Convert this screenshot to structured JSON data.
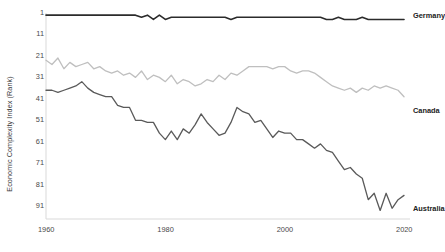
{
  "chart_data": {
    "type": "line",
    "title": "",
    "xlabel": "",
    "ylabel": "Economic Complexity Index (Rank)",
    "xlim": [
      1960,
      2021
    ],
    "ylim": [
      1,
      97
    ],
    "y_inverted": true,
    "grid": false,
    "legend_position": "right-of-line-ends",
    "x_tick_labels": [
      "1960",
      "1980",
      "2000",
      "2020"
    ],
    "x_ticks": [
      1960,
      1980,
      2000,
      2020
    ],
    "y_tick_labels": [
      "1",
      "11",
      "21",
      "31",
      "41",
      "51",
      "61",
      "71",
      "81",
      "91"
    ],
    "y_ticks": [
      1,
      11,
      21,
      31,
      41,
      51,
      61,
      71,
      81,
      91
    ],
    "x": [
      1960,
      1961,
      1962,
      1963,
      1964,
      1965,
      1966,
      1967,
      1968,
      1969,
      1970,
      1971,
      1972,
      1973,
      1974,
      1975,
      1976,
      1977,
      1978,
      1979,
      1980,
      1981,
      1982,
      1983,
      1984,
      1985,
      1986,
      1987,
      1988,
      1989,
      1990,
      1991,
      1992,
      1993,
      1994,
      1995,
      1996,
      1997,
      1998,
      1999,
      2000,
      2001,
      2002,
      2003,
      2004,
      2005,
      2006,
      2007,
      2008,
      2009,
      2010,
      2011,
      2012,
      2013,
      2014,
      2015,
      2016,
      2017,
      2018,
      2019,
      2020
    ],
    "series": [
      {
        "name": "Germany",
        "color": "#2b2b2b",
        "width": 1.6,
        "label_x": 2021,
        "label_y": 2,
        "values": [
          2,
          2,
          2,
          2,
          2,
          2,
          2,
          2,
          2,
          2,
          2,
          2,
          2,
          2,
          2,
          2,
          3,
          2,
          4,
          2,
          4,
          3,
          3,
          3,
          3,
          3,
          3,
          3,
          3,
          3,
          3,
          4,
          3,
          3,
          3,
          3,
          3,
          3,
          3,
          3,
          3,
          3,
          3,
          3,
          3,
          3,
          3,
          4,
          4,
          3,
          4,
          4,
          4,
          3,
          4,
          4,
          4,
          4,
          4,
          4,
          4
        ]
      },
      {
        "name": "Canada",
        "color": "#bfbfbf",
        "width": 1.3,
        "label_x": 2021,
        "label_y": 46,
        "values": [
          23,
          25,
          22,
          27,
          24,
          26,
          25,
          24,
          27,
          26,
          28,
          29,
          28,
          30,
          29,
          31,
          28,
          32,
          30,
          31,
          33,
          30,
          34,
          32,
          33,
          35,
          34,
          32,
          33,
          30,
          32,
          29,
          30,
          28,
          26,
          26,
          26,
          26,
          27,
          26,
          26,
          28,
          29,
          28,
          28,
          29,
          31,
          33,
          35,
          36,
          37,
          36,
          38,
          36,
          37,
          35,
          36,
          35,
          36,
          37,
          40
        ]
      },
      {
        "name": "Australia",
        "color": "#5a5a5a",
        "width": 1.3,
        "label_x": 2021,
        "label_y": 92,
        "values": [
          37,
          37,
          38,
          37,
          36,
          35,
          33,
          36,
          38,
          39,
          40,
          40,
          44,
          45,
          45,
          51,
          51,
          52,
          52,
          57,
          60,
          56,
          60,
          55,
          57,
          53,
          48,
          52,
          55,
          58,
          57,
          52,
          45,
          47,
          48,
          52,
          51,
          55,
          59,
          56,
          57,
          57,
          60,
          60,
          62,
          64,
          62,
          65,
          66,
          70,
          74,
          73,
          76,
          78,
          88,
          85,
          93,
          85,
          92,
          88,
          86
        ]
      }
    ]
  },
  "axis": {
    "y_title": "Economic Complexity Index (Rank)"
  }
}
